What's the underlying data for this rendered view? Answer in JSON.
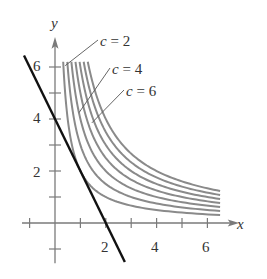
{
  "figure": {
    "axes": {
      "x_label": "x",
      "y_label": "y",
      "x_tick_labels": [
        "2",
        "4",
        "6"
      ],
      "y_tick_labels": [
        "2",
        "4",
        "6"
      ],
      "x_ticks": [
        -1,
        1,
        2,
        3,
        4,
        5,
        6
      ],
      "y_ticks": [
        -1,
        1,
        2,
        3,
        4,
        5,
        6
      ],
      "xlim": [
        -1.3,
        7.3
      ],
      "ylim": [
        -1.5,
        7.2
      ]
    },
    "level_curves": {
      "equation": "xy = c",
      "c_values": [
        2,
        3,
        4,
        5,
        6,
        7,
        8
      ],
      "x_max": 6.5,
      "y_max": 6.2,
      "color": "#8a8a8a"
    },
    "line": {
      "equation": "y = -2x + 4",
      "color": "#111111"
    },
    "annotations": [
      {
        "text": "c = 2",
        "c": 2
      },
      {
        "text": "c = 4",
        "c": 4
      },
      {
        "text": "c = 6",
        "c": 6
      }
    ]
  }
}
